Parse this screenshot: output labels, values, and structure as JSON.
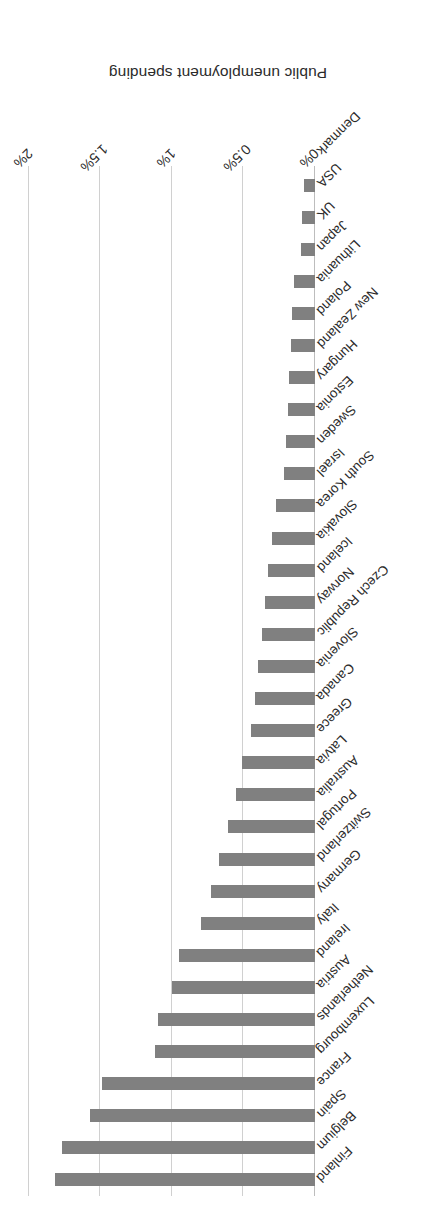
{
  "chart_data": {
    "type": "bar",
    "orientation": "horizontal",
    "title": "",
    "xlabel": "Public unemployment spending",
    "ylabel": "",
    "xlim": [
      0,
      2
    ],
    "value_suffix": "%",
    "grid": true,
    "legend": "none",
    "rotation_note": "figure is printed rotated 180 degrees",
    "bar_color": "#808080",
    "gridline_color": "#d0d0d0",
    "axis_tick_labels": [
      "0%",
      "0.5%",
      "1%",
      "1.5%",
      "2%"
    ],
    "axis_tick_values": [
      0,
      0.5,
      1,
      1.5,
      2
    ],
    "categories": [
      "Finland",
      "Belgium",
      "Spain",
      "France",
      "Luxembourg",
      "Netherlands",
      "Austria",
      "Ireland",
      "Italy",
      "Germany",
      "Switzerland",
      "Portugal",
      "Australia",
      "Latvia",
      "Greece",
      "Canada",
      "Slovenia",
      "Czech Republic",
      "Norway",
      "Iceland",
      "Slovakia",
      "South Korea",
      "Israel",
      "Sweden",
      "Estonia",
      "Hungary",
      "New Zealand",
      "Poland",
      "Lithuania",
      "Japan",
      "UK",
      "USA",
      "Denmark"
    ],
    "values": [
      1.82,
      1.77,
      1.57,
      1.49,
      1.12,
      1.1,
      1.0,
      0.95,
      0.8,
      0.73,
      0.67,
      0.61,
      0.55,
      0.51,
      0.45,
      0.42,
      0.4,
      0.37,
      0.35,
      0.33,
      0.3,
      0.27,
      0.22,
      0.2,
      0.19,
      0.18,
      0.17,
      0.16,
      0.15,
      0.1,
      0.09,
      0.08,
      0.0
    ]
  }
}
